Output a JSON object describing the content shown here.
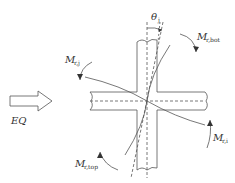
{
  "diagram": {
    "labels": {
      "eq": "EQ",
      "theta": "θ",
      "theta_sub": "j",
      "m_bot": "M",
      "m_bot_sub": "r,bot",
      "m_j": "M",
      "m_j_sub": "r,j",
      "m_i": "M",
      "m_i_sub": "r,i",
      "m_top": "M",
      "m_top_sub": "r,top"
    },
    "colors": {
      "line": "#555555",
      "text": "#333333",
      "background": "#ffffff"
    }
  }
}
